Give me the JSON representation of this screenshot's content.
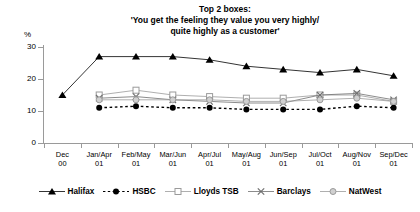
{
  "chart_data": {
    "type": "line",
    "title": "Top 2 boxes:",
    "title_lines": [
      "Top 2 boxes:",
      "'You get the feeling they value you very highly/",
      "quite highly as a customer'"
    ],
    "ylabel": "%",
    "xlabel": "",
    "ylim": [
      0,
      30
    ],
    "yticks": [
      0,
      10,
      20,
      30
    ],
    "ytick_labels": [
      "0",
      "10",
      "20",
      "30"
    ],
    "grid": false,
    "legend_position": "bottom",
    "categories": [
      "Dec",
      "Jan/Apr",
      "Feb/May",
      "Mar/Jun",
      "Apr/Jul",
      "May/Aug",
      "Jun/Sep",
      "Jul/Oct",
      "Aug/Nov",
      "Sep/Dec"
    ],
    "category_years": [
      "00",
      "01",
      "01",
      "01",
      "01",
      "01",
      "01",
      "01",
      "01",
      "01"
    ],
    "series": [
      {
        "name": "Halifax",
        "marker": "filled-triangle",
        "color": "#000000",
        "linestyle": "solid",
        "values": [
          15,
          27,
          27,
          27,
          26,
          24,
          23,
          22,
          23,
          21
        ]
      },
      {
        "name": "HSBC",
        "marker": "filled-circle",
        "color": "#000000",
        "linestyle": "dotted",
        "values": [
          null,
          11,
          11.5,
          11,
          11,
          10.5,
          10.5,
          10.5,
          11.5,
          11
        ]
      },
      {
        "name": "Lloyds TSB",
        "marker": "open-square",
        "color": "#9a9a9a",
        "linestyle": "solid",
        "values": [
          null,
          15,
          16.5,
          15,
          14.5,
          14,
          14,
          15,
          15,
          13
        ]
      },
      {
        "name": "Barclays",
        "marker": "cross",
        "color": "#6f6f6f",
        "linestyle": "solid",
        "values": [
          null,
          14,
          14.5,
          13.5,
          13,
          12.5,
          12.5,
          15,
          15.5,
          13.5
        ]
      },
      {
        "name": "NatWest",
        "marker": "open-circle",
        "color": "#9a9a9a",
        "linestyle": "solid",
        "values": [
          null,
          13.5,
          13.5,
          13.5,
          13.5,
          13,
          13,
          13.5,
          14,
          13
        ]
      }
    ]
  }
}
